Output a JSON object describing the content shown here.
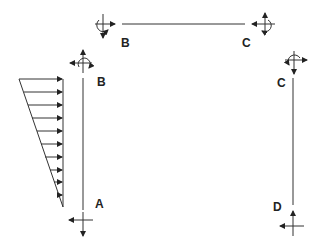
{
  "diagram": {
    "type": "free-body diagram of frame members",
    "colors": {
      "line": "#333333",
      "background": "#ffffff"
    },
    "members": [
      {
        "name": "beam-BC",
        "start_label": "B",
        "end_label": "C",
        "orientation": "horizontal"
      },
      {
        "name": "column-AB",
        "start_label": "A",
        "end_label": "B",
        "orientation": "vertical",
        "load": "triangular distributed load"
      },
      {
        "name": "column-CD",
        "start_label": "C",
        "end_label": "D",
        "orientation": "vertical"
      }
    ],
    "labels": {
      "beam_left": "B",
      "beam_right": "C",
      "left_col_top": "B",
      "left_col_bottom": "A",
      "right_col_top": "C",
      "right_col_bottom": "D"
    },
    "icons": {
      "joint_force": "force-cross-with-moment",
      "support_force": "force-cross",
      "load_arrow": "arrow-right"
    },
    "distributed_load_arrow_count": 10
  }
}
